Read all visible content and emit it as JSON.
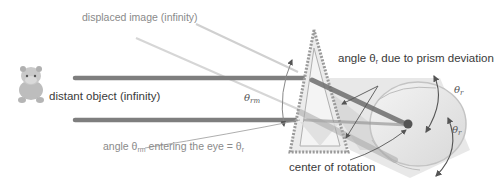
{
  "diagram": {
    "type": "optics-prism-eye-rotation",
    "labels": {
      "displaced_image": "displaced image (infinity)",
      "distant_object": "distant object (infinity)",
      "prism_angle": "angle θ",
      "prism_angle_sub": "r",
      "prism_angle_suffix": " due to prism deviation",
      "entering_eye_prefix": "angle θ",
      "entering_eye_sub": "rm",
      "entering_eye_middle": " entering the eye = θ",
      "entering_eye_sub2": "r",
      "center_of_rotation": "center of rotation",
      "theta_rm": "θ",
      "theta_rm_sub": "rm",
      "theta_r_top": "θ",
      "theta_r_top_sub": "r",
      "theta_r_bottom": "θ",
      "theta_r_bottom_sub": "r"
    },
    "icons": {
      "object": "hippo-toy-icon",
      "eye": "eyeball-icon",
      "prism": "prism-triangle"
    },
    "colors": {
      "beam": "#8a8a8a",
      "beam_light": "#c8c8c8",
      "prism_fill": "#e6e6e6",
      "prism_edge": "#9a9a9a",
      "eye_fill": "#ececec",
      "eye_center": "#555555",
      "arrow": "#555555",
      "text_dark": "#3a3a3a",
      "text_light": "#8a8a8a"
    }
  }
}
